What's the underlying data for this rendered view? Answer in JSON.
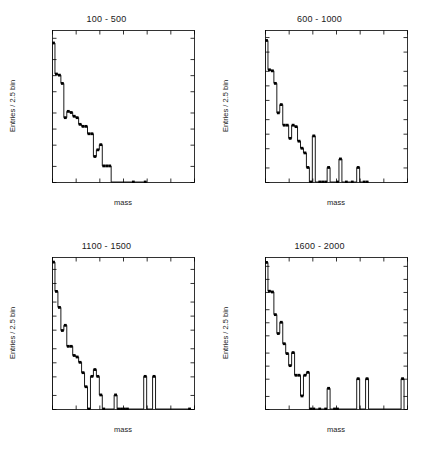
{
  "figure": {
    "background_color": "#ffffff",
    "line_color": "#000000",
    "marker_color": "#000000",
    "panel_count": 4
  },
  "chart_data": [
    {
      "type": "line",
      "title": "100 - 500",
      "xlabel": "mass",
      "ylabel": "Entries / 2.5 bin",
      "yscale": "log",
      "xlim": [
        0,
        120
      ],
      "ylim": [
        1,
        700
      ],
      "grid": false,
      "legend": "none",
      "xticks": [
        0,
        20,
        40,
        60,
        80,
        100,
        120
      ],
      "yticks": [
        1,
        2,
        5,
        10,
        20,
        50,
        100,
        200,
        500
      ],
      "ytick_labels": [
        "1",
        "2",
        "5",
        "10",
        "20",
        "50",
        "100",
        "200",
        "500"
      ],
      "x": [
        1.25,
        3.75,
        6.25,
        8.75,
        11.25,
        13.75,
        16.25,
        18.75,
        21.25,
        23.75,
        26.25,
        28.75,
        31.25,
        33.75,
        36.25,
        38.75,
        41.25,
        43.75,
        46.25,
        48.75,
        68.75,
        78.75
      ],
      "values": [
        400,
        105,
        100,
        70,
        16,
        21,
        20,
        17,
        16,
        12,
        11,
        11,
        8,
        8,
        3,
        4,
        5,
        2,
        2,
        2,
        1,
        1
      ],
      "bin_width": 2.5
    },
    {
      "type": "line",
      "title": "600 - 1000",
      "xlabel": "mass",
      "ylabel": "Entries / 2.5 bin",
      "yscale": "log",
      "xlim": [
        0,
        120
      ],
      "ylim": [
        1,
        1400
      ],
      "grid": false,
      "legend": "none",
      "xticks": [
        0,
        20,
        40,
        60,
        80,
        100,
        120
      ],
      "yticks": [
        1,
        2,
        5,
        10,
        20,
        50,
        100,
        200,
        500,
        1000
      ],
      "ytick_labels": [
        "1",
        "2",
        "5",
        "10",
        "20",
        "50",
        "100",
        "200",
        "500",
        "1000"
      ],
      "x": [
        1.25,
        3.75,
        6.25,
        8.75,
        11.25,
        13.75,
        16.25,
        18.75,
        21.25,
        23.75,
        26.25,
        28.75,
        31.25,
        33.75,
        36.25,
        38.75,
        41.25,
        46.25,
        48.75,
        51.25,
        53.75,
        61.25,
        63.75,
        68.75,
        73.75,
        78.75,
        83.75,
        86.25
      ],
      "values": [
        850,
        210,
        200,
        110,
        27,
        40,
        15,
        15,
        8,
        15,
        14,
        7,
        5,
        4,
        2,
        1,
        9,
        1,
        1,
        1,
        2,
        1,
        3,
        1,
        1,
        2,
        1,
        1
      ],
      "bin_width": 2.5
    },
    {
      "type": "line",
      "title": "1100 - 1500",
      "xlabel": "mass",
      "ylabel": "Entries / 2.5 bin",
      "yscale": "log",
      "xlim": [
        0,
        120
      ],
      "ylim": [
        1,
        1800
      ],
      "grid": false,
      "legend": "none",
      "xticks": [
        0,
        20,
        40,
        60,
        80,
        100,
        120
      ],
      "yticks": [
        1,
        2,
        5,
        10,
        20,
        50,
        100,
        200,
        500,
        1000
      ],
      "ytick_labels": [
        "1",
        "2",
        "5",
        "10",
        "20",
        "50",
        "100",
        "200",
        "500",
        "1000"
      ],
      "x": [
        1.25,
        3.75,
        6.25,
        8.75,
        11.25,
        13.75,
        16.25,
        18.75,
        21.25,
        23.75,
        26.25,
        28.75,
        31.25,
        33.75,
        36.25,
        38.75,
        41.25,
        43.75,
        53.75,
        56.25,
        58.75,
        61.25,
        63.75,
        78.75,
        86.25,
        116.25
      ],
      "values": [
        1400,
        330,
        150,
        48,
        62,
        22,
        22,
        14,
        13,
        10,
        6,
        3,
        1,
        5,
        7,
        5,
        2,
        1,
        2,
        1,
        1,
        1,
        1,
        5,
        5,
        1
      ],
      "bin_width": 2.5
    },
    {
      "type": "line",
      "title": "1600 - 2000",
      "xlabel": "mass",
      "ylabel": "Entries / 2.5 bin",
      "yscale": "log",
      "xlim": [
        0,
        120
      ],
      "ylim": [
        1,
        3200
      ],
      "grid": false,
      "legend": "none",
      "xticks": [
        0,
        20,
        40,
        60,
        80,
        100,
        120
      ],
      "yticks": [
        1,
        2,
        5,
        10,
        20,
        50,
        100,
        200,
        500,
        1000,
        2000
      ],
      "ytick_labels": [
        "1",
        "2",
        "5",
        "10",
        "20",
        "50",
        "100",
        "200",
        "500",
        "1000",
        "2000"
      ],
      "x": [
        1.25,
        3.75,
        6.25,
        8.75,
        11.25,
        13.75,
        16.25,
        18.75,
        21.25,
        23.75,
        26.25,
        28.75,
        31.25,
        33.75,
        36.25,
        38.75,
        41.25,
        46.25,
        51.25,
        53.75,
        58.75,
        61.25,
        78.75,
        86.25,
        116.25
      ],
      "values": [
        2400,
        520,
        500,
        150,
        55,
        100,
        32,
        19,
        10,
        20,
        6,
        6,
        2,
        6,
        7,
        1,
        1,
        1,
        1,
        3,
        1,
        1,
        5,
        5,
        5
      ],
      "bin_width": 2.5
    }
  ]
}
